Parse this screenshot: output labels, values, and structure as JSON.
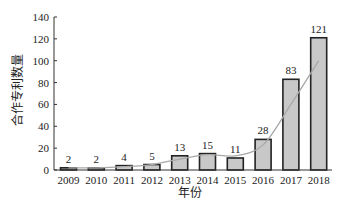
{
  "chart_data": {
    "type": "bar",
    "title": "",
    "xlabel": "年份",
    "ylabel": "合作专利数量",
    "categories": [
      "2009",
      "2010",
      "2011",
      "2012",
      "2013",
      "2014",
      "2015",
      "2016",
      "2017",
      "2018"
    ],
    "values": [
      2,
      2,
      4,
      5,
      13,
      15,
      11,
      28,
      83,
      121
    ],
    "data_labels": [
      "2",
      "2",
      "4",
      "5",
      "13",
      "15",
      "11",
      "28",
      "83",
      "121"
    ],
    "ylim": [
      0,
      140
    ],
    "yticks": [
      0,
      20,
      40,
      60,
      80,
      100,
      120,
      140
    ],
    "grid": false,
    "legend": null,
    "series": [
      {
        "name": "合作专利数量",
        "type": "bar",
        "values": [
          2,
          2,
          4,
          5,
          13,
          15,
          11,
          28,
          83,
          121
        ]
      },
      {
        "name": "趋势线",
        "type": "line",
        "smooth": true,
        "values": [
          2,
          2,
          3,
          5,
          10,
          14,
          13,
          23,
          60,
          100
        ]
      }
    ],
    "colors": {
      "bar_fill": "#c8c8c8",
      "bar_stroke": "#222222",
      "trend_line": "#a8a8a8",
      "axis": "#333333"
    }
  }
}
